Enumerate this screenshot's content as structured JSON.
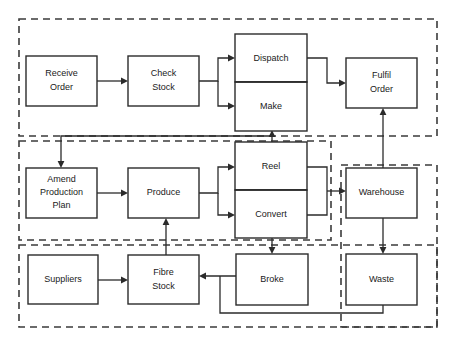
{
  "diagram": {
    "type": "process-flow",
    "canvas": {
      "width": 456,
      "height": 347
    },
    "colors": {
      "background": "#ffffff",
      "node_stroke": "#2b2b2b",
      "node_fill": "#ffffff",
      "group_stroke": "#3b3b3b",
      "connector": "#2b2b2b",
      "text": "#1a1a1a"
    },
    "groups": [
      {
        "id": "group-order",
        "label": "",
        "x": 19,
        "y": 19,
        "w": 418,
        "h": 117,
        "style": "dashed"
      },
      {
        "id": "group-production",
        "label": "",
        "x": 19,
        "y": 141,
        "w": 312,
        "h": 99,
        "style": "dashed"
      },
      {
        "id": "group-supply",
        "label": "",
        "x": 19,
        "y": 245,
        "w": 418,
        "h": 82,
        "style": "dashed"
      },
      {
        "id": "group-warehouse",
        "label": "",
        "x": 341,
        "y": 165,
        "w": 96,
        "h": 162,
        "style": "dashed"
      }
    ],
    "nodes": [
      {
        "id": "receive-order",
        "label": "Receive\nOrder",
        "line1": "Receive",
        "line2": "Order",
        "x": 26,
        "y": 56,
        "w": 71,
        "h": 50
      },
      {
        "id": "check-stock",
        "label": "Check\nStock",
        "line1": "Check",
        "line2": "Stock",
        "x": 128,
        "y": 56,
        "w": 71,
        "h": 50
      },
      {
        "id": "dispatch",
        "label": "Dispatch",
        "line1": "Dispatch",
        "line2": "",
        "x": 235,
        "y": 34,
        "w": 72,
        "h": 48
      },
      {
        "id": "make",
        "label": "Make",
        "line1": "Make",
        "line2": "",
        "x": 235,
        "y": 82,
        "w": 72,
        "h": 49
      },
      {
        "id": "fulfil-order",
        "label": "Fulfil\nOrder",
        "line1": "Fulfil",
        "line2": "Order",
        "x": 346,
        "y": 58,
        "w": 71,
        "h": 50
      },
      {
        "id": "amend-production-plan",
        "label": "Amend\nProduction\nPlan",
        "line1": "Amend",
        "line2": "Production",
        "line3": "Plan",
        "x": 26,
        "y": 168,
        "w": 71,
        "h": 50
      },
      {
        "id": "produce",
        "label": "Produce",
        "line1": "Produce",
        "line2": "",
        "x": 128,
        "y": 168,
        "w": 71,
        "h": 50
      },
      {
        "id": "reel",
        "label": "Reel",
        "line1": "Reel",
        "line2": "",
        "x": 235,
        "y": 142,
        "w": 72,
        "h": 48
      },
      {
        "id": "convert",
        "label": "Convert",
        "line1": "Convert",
        "line2": "",
        "x": 235,
        "y": 190,
        "w": 72,
        "h": 48
      },
      {
        "id": "warehouse",
        "label": "Warehouse",
        "line1": "Warehouse",
        "line2": "",
        "x": 346,
        "y": 168,
        "w": 71,
        "h": 50
      },
      {
        "id": "suppliers",
        "label": "Suppliers",
        "line1": "Suppliers",
        "line2": "",
        "x": 28,
        "y": 255,
        "w": 70,
        "h": 49
      },
      {
        "id": "fibre-stock",
        "label": "Fibre\nStock",
        "line1": "Fibre",
        "line2": "Stock",
        "x": 128,
        "y": 255,
        "w": 71,
        "h": 49
      },
      {
        "id": "broke",
        "label": "Broke",
        "line1": "Broke",
        "line2": "",
        "x": 236,
        "y": 254,
        "w": 72,
        "h": 51
      },
      {
        "id": "waste",
        "label": "Waste",
        "line1": "Waste",
        "line2": "",
        "x": 346,
        "y": 254,
        "w": 71,
        "h": 51
      }
    ],
    "connectors": [
      {
        "id": "receive-order-to-check-stock",
        "from": "receive-order",
        "to": "check-stock",
        "points": "97,81 126,81",
        "arrow_at": "126,81",
        "arrow_dir": "right"
      },
      {
        "id": "check-stock-to-dispatch",
        "from": "check-stock",
        "to": "dispatch",
        "points": "199,81 218,81 218,58 233,58",
        "arrow_at": "233,58",
        "arrow_dir": "right"
      },
      {
        "id": "check-stock-to-make",
        "from": "check-stock",
        "to": "make",
        "points": "218,81 218,106 233,106",
        "arrow_at": "233,106",
        "arrow_dir": "right"
      },
      {
        "id": "dispatch-to-fulfil-order",
        "from": "dispatch",
        "to": "fulfil-order",
        "points": "307,58 327,58 327,83 344,83",
        "arrow_at": "344,83",
        "arrow_dir": "right"
      },
      {
        "id": "make-to-amend-production-plan",
        "from": "make",
        "to": "amend-production-plan",
        "points": "272,136 61,136 61,166",
        "arrow_at": "61,166",
        "arrow_dir": "down"
      },
      {
        "id": "reel-to-make",
        "from": "reel",
        "to": "make",
        "points": "272,142 272,133",
        "arrow_at": "272,133",
        "arrow_dir": "up"
      },
      {
        "id": "amend-production-plan-to-produce",
        "from": "amend-production-plan",
        "to": "produce",
        "points": "97,193 126,193",
        "arrow_at": "126,193",
        "arrow_dir": "right"
      },
      {
        "id": "produce-to-reel",
        "from": "produce",
        "to": "reel",
        "points": "199,193 218,193 218,167 233,167",
        "arrow_at": "233,167",
        "arrow_dir": "right"
      },
      {
        "id": "produce-to-convert",
        "from": "produce",
        "to": "convert",
        "points": "218,193 218,215 233,215",
        "arrow_at": "233,215",
        "arrow_dir": "right"
      },
      {
        "id": "reel-to-warehouse",
        "from": "reel",
        "to": "warehouse",
        "points": "307,167 327,167 327,191 344,191",
        "arrow_at": "344,191",
        "arrow_dir": "right"
      },
      {
        "id": "convert-to-warehouse",
        "from": "convert",
        "to": "warehouse",
        "points": "307,215 327,215 327,191",
        "arrow_at": "",
        "arrow_dir": ""
      },
      {
        "id": "warehouse-to-fulfil-order",
        "from": "warehouse",
        "to": "fulfil-order",
        "points": "383,168 383,110",
        "arrow_at": "383,110",
        "arrow_dir": "up"
      },
      {
        "id": "warehouse-to-waste",
        "from": "warehouse",
        "to": "waste",
        "points": "383,218 383,252",
        "arrow_at": "383,252",
        "arrow_dir": "down"
      },
      {
        "id": "convert-to-broke",
        "from": "convert",
        "to": "broke",
        "points": "272,238 272,252",
        "arrow_at": "272,252",
        "arrow_dir": "down"
      },
      {
        "id": "suppliers-to-fibre-stock",
        "from": "suppliers",
        "to": "fibre-stock",
        "points": "98,280 126,280",
        "arrow_at": "126,280",
        "arrow_dir": "right"
      },
      {
        "id": "broke-to-fibre-stock",
        "from": "broke",
        "to": "fibre-stock",
        "points": "236,276 201,276",
        "arrow_at": "201,276",
        "arrow_dir": "left"
      },
      {
        "id": "waste-to-fibre-stock",
        "from": "waste",
        "to": "fibre-stock",
        "points": "383,305 383,313 220,313 220,276",
        "arrow_at": "",
        "arrow_dir": ""
      },
      {
        "id": "fibre-stock-to-produce",
        "from": "fibre-stock",
        "to": "produce",
        "points": "166,255 166,220",
        "arrow_at": "166,220",
        "arrow_dir": "up"
      }
    ]
  }
}
